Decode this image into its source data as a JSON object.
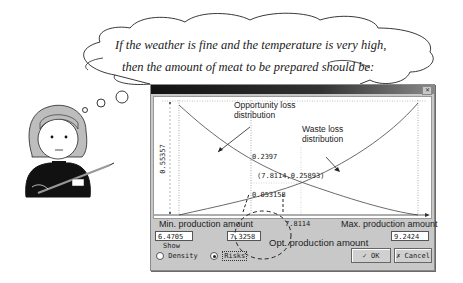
{
  "thought_bubble": {
    "line1": "If the weather is fine and the temperature is very high,",
    "line2": "then the amount of meat to be prepared should be:"
  },
  "dialog": {
    "title": "",
    "close_icon": "close-icon",
    "plot": {
      "y_axis_value": "0.55357",
      "curve_labels": {
        "opportunity": "Opportunity loss distribution",
        "opportunity_line1": "Opportunity loss",
        "opportunity_line2": "distribution",
        "waste": "Waste loss distribution",
        "waste_line1": "Waste loss",
        "waste_line2": "distribution"
      },
      "value_opportunity_at_opt": "0.2397",
      "intersection_label": "(7.8114,0.25893)",
      "value_waste_at_opt": "0.053158",
      "x_opt_tick": "7.8114",
      "min_label": "Min. production amount",
      "max_label": "Max. production amount"
    },
    "fields": {
      "min_value": "6.4705",
      "opt_value": "7.3258",
      "max_value": "9.2424"
    },
    "opt_annotation": "Opt. production amount",
    "show_group": {
      "label": "Show",
      "options": [
        {
          "label": "Density",
          "selected": false
        },
        {
          "label": "Risks",
          "selected": true
        }
      ]
    },
    "buttons": {
      "ok": "OK",
      "ok_icon": "check-icon",
      "cancel": "Cancel",
      "cancel_icon": "running-man-icon"
    }
  }
}
